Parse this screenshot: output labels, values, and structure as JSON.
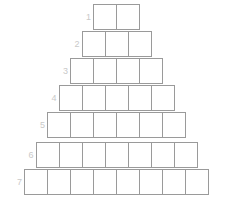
{
  "figure": {
    "background_color": "#ffffff",
    "cell_border_color": "#9a9a9a",
    "cell_fill_color": "#ffffff",
    "label_color": "#c9c9c9",
    "cell_width_px": 24,
    "cell_height_px": 26,
    "row_count": 7
  },
  "rows": [
    {
      "label": "1",
      "cells": 2,
      "top": 4,
      "cell_values": [
        "",
        ""
      ]
    },
    {
      "label": "2",
      "cells": 3,
      "top": 31,
      "cell_values": [
        "",
        "",
        ""
      ]
    },
    {
      "label": "3",
      "cells": 4,
      "top": 58,
      "cell_values": [
        "",
        "",
        "",
        ""
      ]
    },
    {
      "label": "4",
      "cells": 5,
      "top": 85,
      "cell_values": [
        "",
        "",
        "",
        "",
        ""
      ]
    },
    {
      "label": "5",
      "cells": 6,
      "top": 112,
      "cell_values": [
        "",
        "",
        "",
        "",
        "",
        ""
      ]
    },
    {
      "label": "6",
      "cells": 7,
      "top": 142,
      "cell_values": [
        "",
        "",
        "",
        "",
        "",
        "",
        ""
      ]
    },
    {
      "label": "7",
      "cells": 8,
      "top": 169,
      "cell_values": [
        "",
        "",
        "",
        "",
        "",
        "",
        "",
        ""
      ]
    }
  ]
}
